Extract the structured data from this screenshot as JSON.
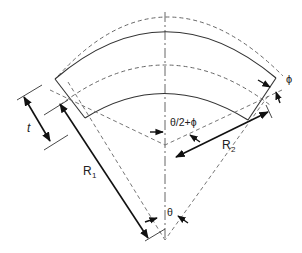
{
  "diagram": {
    "labels": {
      "thickness": "t",
      "radius1_main": "R",
      "radius1_sub": "1",
      "radius2_main": "R",
      "radius2_sub": "2",
      "angle_half": "θ/2+ϕ",
      "angle_theta": "θ",
      "angle_phi": "ϕ"
    },
    "colors": {
      "solid_line": "#333333",
      "dashed_line": "#666666",
      "arrow": "#111111",
      "text": "#222222"
    }
  }
}
